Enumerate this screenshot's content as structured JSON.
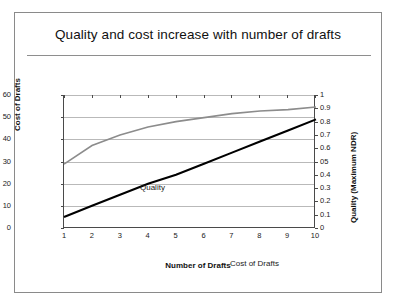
{
  "slide": {
    "title": "Quality and cost increase with number of drafts"
  },
  "colors": {
    "quality_line": "#8c8c8c",
    "cost_line": "#000000",
    "gridline": "#b9b9b9",
    "axis": "#4a4a4a",
    "border": "#8a8a8a"
  },
  "chart_data": {
    "type": "line",
    "title": "Quality and cost increase with number of drafts",
    "xlabel": "Number of Drafts",
    "ylabel": "Cost of Drafts",
    "y2label": "Quality (Maximum NDR)",
    "x": [
      1,
      2,
      3,
      4,
      5,
      6,
      7,
      8,
      9,
      10
    ],
    "xtick_labels": [
      "1",
      "2",
      "3",
      "4",
      "5",
      "6",
      "7",
      "8",
      "9",
      "10"
    ],
    "xlim": [
      1,
      10
    ],
    "ylim": [
      0,
      60
    ],
    "ytick_labels": [
      "0",
      "10",
      "20",
      "30",
      "40",
      "50",
      "60"
    ],
    "ytick_values": [
      0,
      10,
      20,
      30,
      40,
      50,
      60
    ],
    "y2lim": [
      0,
      1
    ],
    "y2tick_labels": [
      "0",
      "0.1",
      "0.2",
      "0.3",
      "0.4",
      "05",
      "0.6",
      "0.7",
      "0.8",
      "0.9",
      "1"
    ],
    "y2tick_values": [
      0,
      0.1,
      0.2,
      0.3,
      0.4,
      0.5,
      0.6,
      0.7,
      0.8,
      0.9,
      1
    ],
    "grid": true,
    "legend": "inline-labels",
    "series": [
      {
        "name": "Quality",
        "axis": "right",
        "label_text": "Quality",
        "color": "#8c8c8c",
        "values": [
          0.48,
          0.62,
          0.7,
          0.76,
          0.8,
          0.83,
          0.86,
          0.88,
          0.89,
          0.91
        ]
      },
      {
        "name": "Cost of Drafts",
        "axis": "left",
        "label_text": "Cost of Drafts",
        "color": "#000000",
        "values": [
          5,
          10,
          15,
          20,
          24,
          29,
          34,
          39,
          44,
          49
        ]
      }
    ]
  }
}
